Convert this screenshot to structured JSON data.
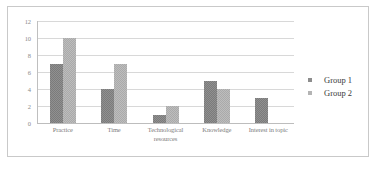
{
  "chart_data": {
    "type": "bar",
    "title": "",
    "subtitle": "",
    "xlabel": "",
    "ylabel": "",
    "ylim": [
      0,
      12
    ],
    "y_ticks": [
      0,
      2,
      4,
      6,
      8,
      10,
      12
    ],
    "grid": true,
    "legend_position": "right",
    "categories": [
      "Practice",
      "Time",
      "Technological resources",
      "Knowledge",
      "Interest in topic"
    ],
    "series": [
      {
        "name": "Group 1",
        "color": "#7b7b7b",
        "values": [
          7,
          4,
          1,
          5,
          3
        ]
      },
      {
        "name": "Group 2",
        "color": "#aaaaaa",
        "values": [
          10,
          7,
          2,
          4,
          null
        ]
      }
    ]
  },
  "legend": {
    "items": [
      {
        "label": "Group 1",
        "marker": "square-marker"
      },
      {
        "label": "Group 2",
        "marker": "square-marker"
      }
    ]
  }
}
